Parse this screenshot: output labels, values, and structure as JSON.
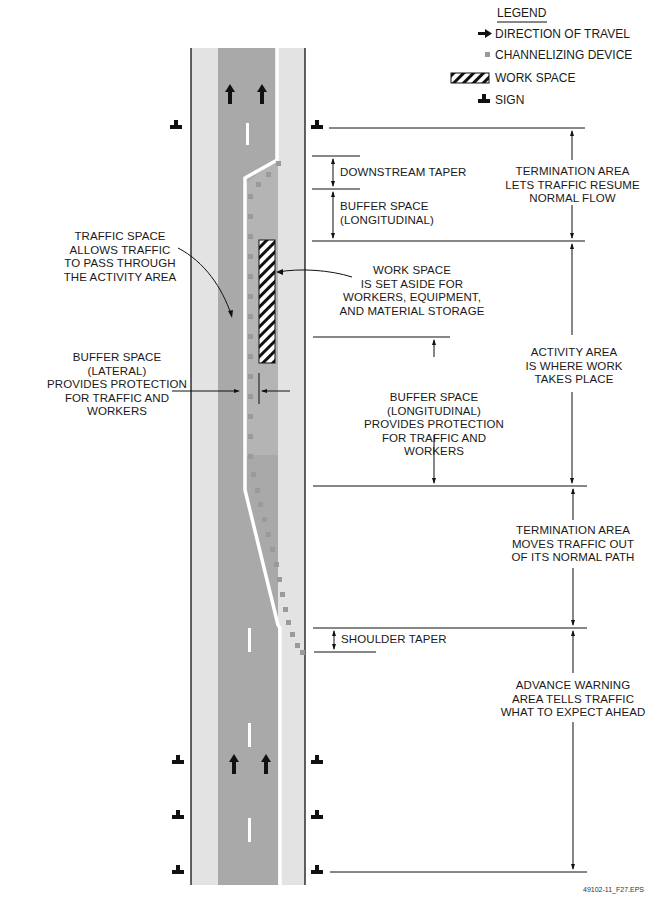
{
  "legend": {
    "title": "LEGEND",
    "items": [
      {
        "icon": "arrow-right-icon",
        "label": "DIRECTION OF TRAVEL"
      },
      {
        "icon": "channelizing-device-icon",
        "label": "CHANNELIZING DEVICE"
      },
      {
        "icon": "hatched-workspace-icon",
        "label": "WORK SPACE"
      },
      {
        "icon": "sign-icon",
        "label": "SIGN"
      }
    ]
  },
  "labels": {
    "downstream_taper": "DOWNSTREAM TAPER",
    "buffer_longitudinal_top": [
      "BUFFER SPACE",
      "(LONGITUDINAL)"
    ],
    "termination_resume": [
      "TERMINATION AREA",
      "LETS TRAFFIC RESUME",
      "NORMAL FLOW"
    ],
    "traffic_space": [
      "TRAFFIC SPACE",
      "ALLOWS TRAFFIC",
      "TO PASS THROUGH",
      "THE ACTIVITY AREA"
    ],
    "work_space": [
      "WORK SPACE",
      "IS SET ASIDE FOR",
      "WORKERS, EQUIPMENT,",
      "AND MATERIAL STORAGE"
    ],
    "buffer_lateral": [
      "BUFFER SPACE",
      "(LATERAL)",
      "PROVIDES PROTECTION",
      "FOR TRAFFIC AND",
      "WORKERS"
    ],
    "activity_area": [
      "ACTIVITY AREA",
      "IS WHERE WORK",
      "TAKES PLACE"
    ],
    "buffer_longitudinal_mid": [
      "BUFFER SPACE",
      "(LONGITUDINAL)",
      "PROVIDES PROTECTION",
      "FOR TRAFFIC AND",
      "WORKERS"
    ],
    "termination_moves": [
      "TERMINATION AREA",
      "MOVES TRAFFIC OUT",
      "OF ITS NORMAL PATH"
    ],
    "shoulder_taper": "SHOULDER TAPER",
    "advance_warning": [
      "ADVANCE WARNING",
      "AREA TELLS TRAFFIC",
      "WHAT TO EXPECT AHEAD"
    ]
  },
  "figure_id": "49102-11_F27.EPS",
  "colors": {
    "shoulder": "#e3e3e3",
    "lane": "#a9a9a9",
    "closed_lane": "#b9b9b9",
    "device": "#9a9a9a",
    "ink": "#111111"
  }
}
